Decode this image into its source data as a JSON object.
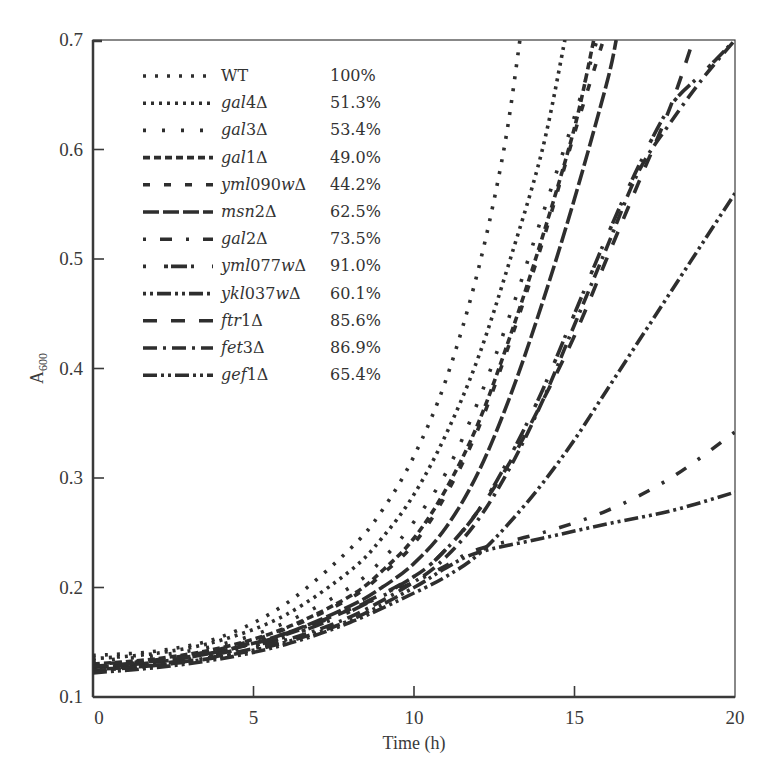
{
  "chart_data": {
    "type": "line",
    "title": "",
    "xlabel": "Time (h)",
    "ylabel": "A600",
    "ylabel_main": "A",
    "ylabel_sub": "600",
    "xlim": [
      0,
      20
    ],
    "ylim": [
      0.1,
      0.7
    ],
    "xticks": [
      0,
      5,
      10,
      15,
      20
    ],
    "xtick_labels": [
      "0",
      "5",
      "10",
      "15",
      "20"
    ],
    "yticks": [
      0.1,
      0.2,
      0.3,
      0.4,
      0.5,
      0.6,
      0.7
    ],
    "ytick_labels": [
      "0.1",
      "0.2",
      "0.3",
      "0.4",
      "0.5",
      "0.6",
      "0.7"
    ],
    "grid": false,
    "legend_position": "top-left",
    "line_color": "#2e2e2e",
    "series": [
      {
        "name": "WT",
        "italic_part": "",
        "plain_part": "WT",
        "delta": false,
        "pct": "100%",
        "dash": "3,9",
        "points": [
          [
            0,
            0.138
          ],
          [
            2,
            0.142
          ],
          [
            4,
            0.155
          ],
          [
            6,
            0.185
          ],
          [
            8,
            0.235
          ],
          [
            9,
            0.27
          ],
          [
            10,
            0.32
          ],
          [
            11,
            0.39
          ],
          [
            12,
            0.49
          ],
          [
            12.8,
            0.6
          ],
          [
            13.3,
            0.7
          ]
        ]
      },
      {
        "name": "gal4Δ",
        "italic_part": "gal",
        "plain_part": "4",
        "delta": true,
        "pct": "51.3%",
        "dash": "3,5",
        "points": [
          [
            0,
            0.135
          ],
          [
            2,
            0.14
          ],
          [
            4,
            0.152
          ],
          [
            6,
            0.175
          ],
          [
            8,
            0.215
          ],
          [
            9,
            0.245
          ],
          [
            10,
            0.285
          ],
          [
            11,
            0.34
          ],
          [
            12,
            0.41
          ],
          [
            13,
            0.5
          ],
          [
            14,
            0.6
          ],
          [
            14.7,
            0.7
          ]
        ]
      },
      {
        "name": "gal3Δ",
        "italic_part": "gal",
        "plain_part": "3",
        "delta": true,
        "pct": "53.4%",
        "dash": "3,16",
        "points": [
          [
            0,
            0.133
          ],
          [
            2,
            0.138
          ],
          [
            4,
            0.148
          ],
          [
            6,
            0.168
          ],
          [
            8,
            0.2
          ],
          [
            9,
            0.225
          ],
          [
            10,
            0.26
          ],
          [
            11,
            0.305
          ],
          [
            12,
            0.37
          ],
          [
            13,
            0.45
          ],
          [
            14,
            0.54
          ],
          [
            15,
            0.63
          ],
          [
            15.7,
            0.7
          ]
        ]
      },
      {
        "name": "gal1Δ",
        "italic_part": "gal",
        "plain_part": "1",
        "delta": true,
        "pct": "49.0%",
        "dash": "7,4",
        "points": [
          [
            0,
            0.13
          ],
          [
            2,
            0.135
          ],
          [
            4,
            0.145
          ],
          [
            6,
            0.163
          ],
          [
            8,
            0.192
          ],
          [
            9,
            0.215
          ],
          [
            10,
            0.245
          ],
          [
            11,
            0.29
          ],
          [
            12,
            0.35
          ],
          [
            13,
            0.43
          ],
          [
            14,
            0.52
          ],
          [
            15,
            0.62
          ],
          [
            15.6,
            0.7
          ]
        ]
      },
      {
        "name": "yml090wΔ",
        "italic_part": "yml",
        "plain_part": "090",
        "italic_part2": "w",
        "delta": true,
        "pct": "44.2%",
        "dash": "7,14",
        "points": [
          [
            0,
            0.128
          ],
          [
            2,
            0.134
          ],
          [
            4,
            0.144
          ],
          [
            6,
            0.162
          ],
          [
            8,
            0.19
          ],
          [
            9,
            0.212
          ],
          [
            10,
            0.24
          ],
          [
            11,
            0.285
          ],
          [
            12,
            0.345
          ],
          [
            13,
            0.425
          ],
          [
            14,
            0.515
          ],
          [
            15,
            0.615
          ],
          [
            15.9,
            0.7
          ]
        ]
      },
      {
        "name": "msn2Δ",
        "italic_part": "msn",
        "plain_part": "2",
        "delta": true,
        "pct": "62.5%",
        "dash": "16,4",
        "points": [
          [
            0,
            0.127
          ],
          [
            2,
            0.132
          ],
          [
            4,
            0.142
          ],
          [
            6,
            0.158
          ],
          [
            8,
            0.183
          ],
          [
            9,
            0.2
          ],
          [
            10,
            0.222
          ],
          [
            11,
            0.255
          ],
          [
            12,
            0.305
          ],
          [
            13,
            0.375
          ],
          [
            14,
            0.46
          ],
          [
            15,
            0.555
          ],
          [
            16,
            0.66
          ],
          [
            16.3,
            0.7
          ]
        ]
      },
      {
        "name": "gal2Δ",
        "italic_part": "gal",
        "plain_part": "2",
        "delta": true,
        "pct": "73.5%",
        "dash": "3,14,12,14",
        "points": [
          [
            0,
            0.13
          ],
          [
            2,
            0.134
          ],
          [
            4,
            0.143
          ],
          [
            6,
            0.158
          ],
          [
            8,
            0.18
          ],
          [
            10,
            0.205
          ],
          [
            11,
            0.22
          ],
          [
            12,
            0.235
          ],
          [
            14,
            0.25
          ],
          [
            16,
            0.27
          ],
          [
            18,
            0.3
          ],
          [
            20,
            0.342
          ]
        ]
      },
      {
        "name": "yml077wΔ",
        "italic_part": "yml",
        "plain_part": "077",
        "italic_part2": "w",
        "delta": true,
        "pct": "91.0%",
        "dash": "3,18,4,3,16,4",
        "points": [
          [
            0,
            0.125
          ],
          [
            2,
            0.13
          ],
          [
            4,
            0.14
          ],
          [
            6,
            0.155
          ],
          [
            8,
            0.178
          ],
          [
            10,
            0.21
          ],
          [
            11,
            0.235
          ],
          [
            12,
            0.27
          ],
          [
            13,
            0.32
          ],
          [
            14,
            0.38
          ],
          [
            15,
            0.45
          ],
          [
            16,
            0.52
          ],
          [
            17,
            0.585
          ],
          [
            18,
            0.64
          ],
          [
            19,
            0.67
          ],
          [
            20,
            0.7
          ]
        ]
      },
      {
        "name": "ykl037wΔ",
        "italic_part": "ykl",
        "plain_part": "037",
        "italic_part2": "w",
        "delta": true,
        "pct": "60.1%",
        "dash": "3,4,3,4,14,4",
        "points": [
          [
            0,
            0.125
          ],
          [
            2,
            0.129
          ],
          [
            4,
            0.137
          ],
          [
            6,
            0.15
          ],
          [
            8,
            0.17
          ],
          [
            10,
            0.2
          ],
          [
            11,
            0.218
          ],
          [
            12,
            0.232
          ],
          [
            14,
            0.245
          ],
          [
            16,
            0.258
          ],
          [
            18,
            0.27
          ],
          [
            20,
            0.287
          ]
        ]
      },
      {
        "name": "ftr1Δ",
        "italic_part": "ftr",
        "plain_part": "1",
        "delta": true,
        "pct": "85.6%",
        "dash": "14,14",
        "points": [
          [
            0,
            0.128
          ],
          [
            2,
            0.133
          ],
          [
            4,
            0.142
          ],
          [
            6,
            0.157
          ],
          [
            8,
            0.18
          ],
          [
            10,
            0.21
          ],
          [
            11,
            0.235
          ],
          [
            12,
            0.27
          ],
          [
            13,
            0.315
          ],
          [
            14,
            0.37
          ],
          [
            15,
            0.43
          ],
          [
            16,
            0.5
          ],
          [
            17,
            0.57
          ],
          [
            18,
            0.64
          ],
          [
            18.7,
            0.7
          ]
        ]
      },
      {
        "name": "fet3Δ",
        "italic_part": "fet",
        "plain_part": "3",
        "delta": true,
        "pct": "86.9%",
        "dash": "14,6,3,6",
        "points": [
          [
            0,
            0.124
          ],
          [
            2,
            0.129
          ],
          [
            4,
            0.138
          ],
          [
            6,
            0.152
          ],
          [
            8,
            0.173
          ],
          [
            10,
            0.205
          ],
          [
            11,
            0.228
          ],
          [
            12,
            0.262
          ],
          [
            13,
            0.31
          ],
          [
            14,
            0.37
          ],
          [
            15,
            0.44
          ],
          [
            16,
            0.51
          ],
          [
            17,
            0.58
          ],
          [
            18,
            0.625
          ],
          [
            19,
            0.665
          ],
          [
            20,
            0.7
          ]
        ]
      },
      {
        "name": "gef1Δ",
        "italic_part": "gef",
        "plain_part": "1",
        "delta": true,
        "pct": "65.4%",
        "dash": "14,4,3,4,3,4",
        "points": [
          [
            0,
            0.122
          ],
          [
            2,
            0.127
          ],
          [
            4,
            0.135
          ],
          [
            6,
            0.148
          ],
          [
            8,
            0.168
          ],
          [
            10,
            0.195
          ],
          [
            11,
            0.21
          ],
          [
            12,
            0.23
          ],
          [
            13,
            0.26
          ],
          [
            14,
            0.295
          ],
          [
            15,
            0.335
          ],
          [
            16,
            0.38
          ],
          [
            17,
            0.425
          ],
          [
            18,
            0.47
          ],
          [
            19,
            0.515
          ],
          [
            20,
            0.56
          ]
        ]
      }
    ]
  },
  "header_fragment": "ng p                                y          y         gy"
}
